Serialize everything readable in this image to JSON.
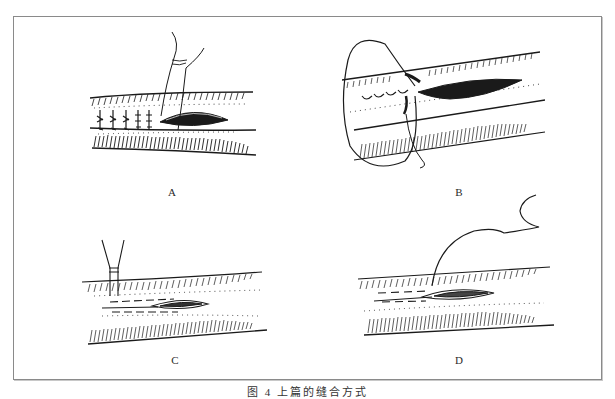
{
  "figure": {
    "panels": [
      {
        "id": "A",
        "label": "A",
        "description": "interrupted sutures tied along incision, needle with thread above"
      },
      {
        "id": "B",
        "label": "B",
        "description": "continuous suture loop being placed along incision"
      },
      {
        "id": "C",
        "label": "C",
        "description": "needle-holder / forceps at incision with dashed stitch line"
      },
      {
        "id": "D",
        "label": "D",
        "description": "curved thread entering incision with dashed subcuticular stitch line"
      }
    ],
    "caption": "图 4  上篇的缝合方式",
    "colors": {
      "ink": "#1a1a1a",
      "frame": "#8a8a8a",
      "background": "#ffffff"
    }
  }
}
